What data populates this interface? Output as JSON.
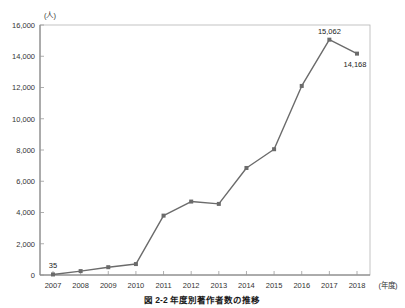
{
  "figure": {
    "caption": "図 2-2 年度別著作者数の推移",
    "background_color": "#ffffff"
  },
  "chart_data": {
    "type": "line",
    "title": "",
    "xlabel": "(年度)",
    "ylabel": "(人)",
    "categories": [
      "2007",
      "2008",
      "2009",
      "2010",
      "2011",
      "2012",
      "2013",
      "2014",
      "2015",
      "2016",
      "2017",
      "2018"
    ],
    "values": [
      35,
      250,
      500,
      700,
      3800,
      4700,
      4550,
      6850,
      8050,
      12100,
      15062,
      14168
    ],
    "point_labels": [
      {
        "category": "2007",
        "text": "35",
        "position": "above"
      },
      {
        "category": "2017",
        "text": "15,062",
        "position": "above"
      },
      {
        "category": "2018",
        "text": "14,168",
        "position": "below-right"
      }
    ],
    "ylim": [
      0,
      16000
    ],
    "y_ticks": [
      0,
      2000,
      4000,
      6000,
      8000,
      10000,
      12000,
      14000,
      16000
    ],
    "y_tick_labels": [
      "0",
      "2,000",
      "4,000",
      "6,000",
      "8,000",
      "10,000",
      "12,000",
      "14,000",
      "16,000"
    ],
    "grid": false,
    "legend": "none",
    "series_color": "#6b6b6b",
    "marker": "square",
    "axis_color": "#9a9a9a"
  }
}
